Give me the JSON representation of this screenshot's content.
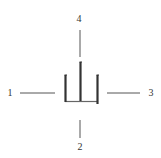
{
  "diagram": {
    "labels": {
      "left": "1",
      "bottom": "2",
      "right": "3",
      "top": "4"
    },
    "colors": {
      "background": "#ffffff",
      "stroke": "#333333",
      "thin_line": "#555555"
    }
  }
}
